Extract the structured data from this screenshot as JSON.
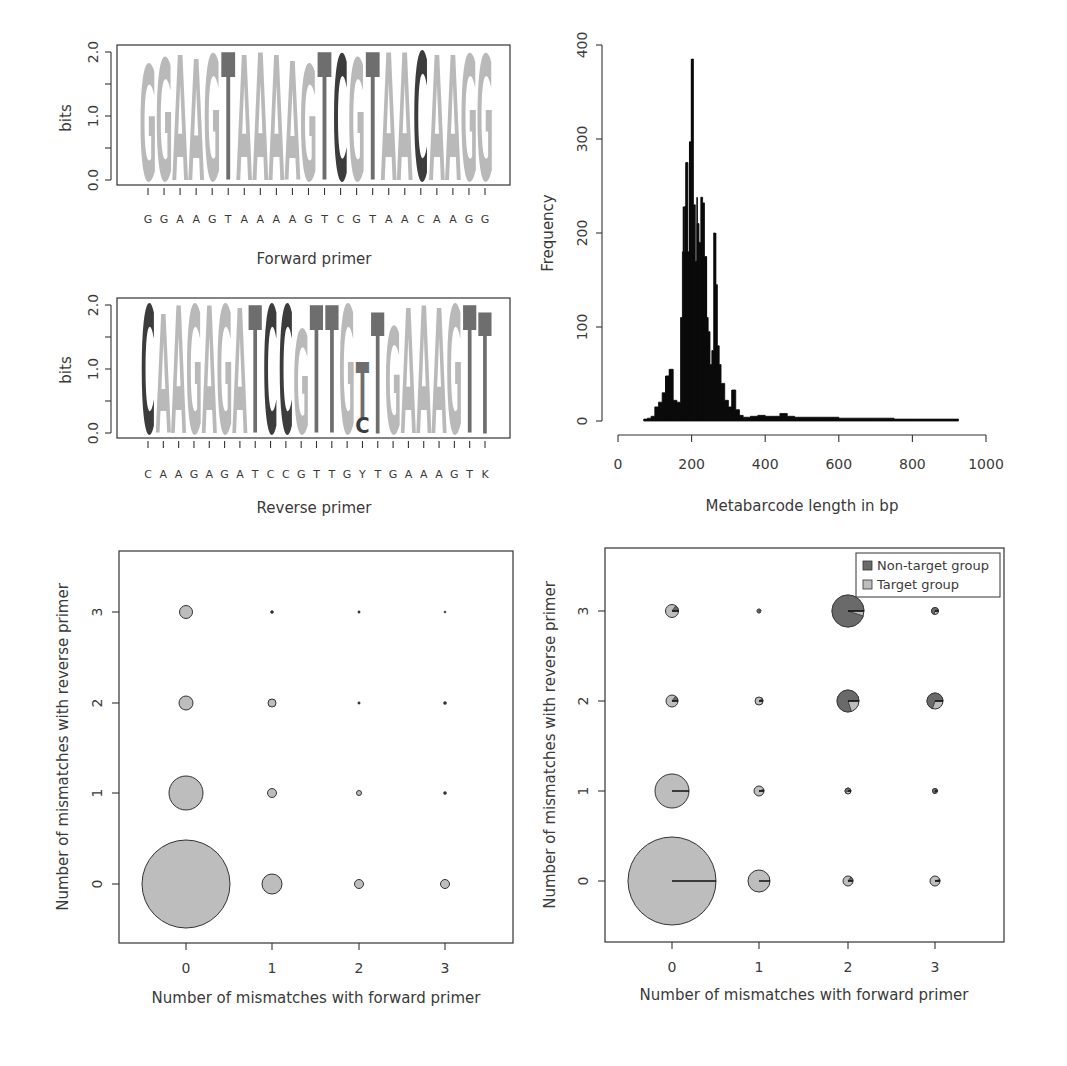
{
  "colors": {
    "A": "#b9b9b9",
    "G": "#b9b9b9",
    "C": "#3c3c3c",
    "T": "#6e6e6e",
    "target": "#bdbdbd",
    "non_target": "#6a6a6a",
    "histogram": "#0a0a0a",
    "axis": "#333333"
  },
  "chart_data": [
    {
      "id": "forward-logo",
      "type": "sequence-logo",
      "title": "",
      "xlabel": "Forward primer",
      "ylabel": "bits",
      "ylim": [
        0,
        2.0
      ],
      "yticks": [
        "0.0",
        "1.0",
        "2.0"
      ],
      "consensus": [
        "G",
        "G",
        "A",
        "A",
        "G",
        "T",
        "A",
        "A",
        "A",
        "A",
        "G",
        "T",
        "C",
        "G",
        "T",
        "A",
        "A",
        "C",
        "A",
        "A",
        "G",
        "G"
      ],
      "heights": [
        1.8,
        1.9,
        1.95,
        1.9,
        1.95,
        2.0,
        1.95,
        2.0,
        1.95,
        1.85,
        1.8,
        2.0,
        1.95,
        1.9,
        2.0,
        2.0,
        2.0,
        2.0,
        1.95,
        1.95,
        1.95,
        1.95
      ]
    },
    {
      "id": "reverse-logo",
      "type": "sequence-logo",
      "title": "",
      "xlabel": "Reverse primer",
      "ylabel": "bits",
      "ylim": [
        0,
        2.0
      ],
      "yticks": [
        "0.0",
        "1.0",
        "2.0"
      ],
      "consensus": [
        "C",
        "A",
        "A",
        "G",
        "A",
        "G",
        "A",
        "T",
        "C",
        "C",
        "G",
        "T",
        "T",
        "G",
        "Y",
        "T",
        "G",
        "A",
        "A",
        "A",
        "G",
        "T",
        "K"
      ],
      "heights": [
        2.0,
        1.85,
        2.0,
        2.0,
        2.0,
        2.0,
        1.95,
        2.0,
        2.0,
        2.0,
        1.6,
        2.0,
        2.0,
        2.0,
        1.2,
        1.9,
        1.65,
        1.95,
        2.0,
        1.95,
        2.0,
        2.0,
        1.9
      ],
      "stack_note": "Position Y: T (upper) over C (lower); position K: T dominant"
    },
    {
      "id": "length-histogram",
      "type": "bar",
      "title": "",
      "xlabel": "Metabarcode length in bp",
      "ylabel": "Frequency",
      "xlim": [
        0,
        1000
      ],
      "ylim": [
        0,
        400
      ],
      "xticks": [
        "0",
        "200",
        "400",
        "600",
        "800",
        "1000"
      ],
      "yticks": [
        "0",
        "100",
        "200",
        "300",
        "400"
      ],
      "x": [
        70,
        80,
        90,
        100,
        110,
        120,
        130,
        140,
        150,
        160,
        170,
        175,
        180,
        185,
        190,
        195,
        200,
        205,
        210,
        215,
        220,
        225,
        230,
        235,
        240,
        245,
        250,
        255,
        260,
        265,
        270,
        275,
        280,
        290,
        300,
        310,
        320,
        330,
        340,
        360,
        380,
        400,
        420,
        440,
        460,
        480,
        500,
        550,
        600,
        650,
        700,
        750,
        800,
        850,
        900,
        920
      ],
      "values": [
        2,
        3,
        5,
        15,
        20,
        30,
        48,
        55,
        22,
        20,
        110,
        180,
        228,
        275,
        180,
        297,
        385,
        230,
        170,
        210,
        190,
        238,
        232,
        175,
        110,
        95,
        60,
        75,
        200,
        145,
        80,
        60,
        40,
        22,
        15,
        33,
        12,
        6,
        4,
        5,
        6,
        5,
        5,
        8,
        5,
        4,
        4,
        4,
        3,
        3,
        3,
        2,
        2,
        2,
        2,
        2
      ]
    },
    {
      "id": "mismatch-bubble",
      "type": "scatter",
      "title": "",
      "xlabel": "Number of mismatches with forward primer",
      "ylabel": "Number of mismatches with reverse primer",
      "xticks": [
        "0",
        "1",
        "2",
        "3"
      ],
      "yticks": [
        "0",
        "1",
        "2",
        "3"
      ],
      "points": [
        {
          "x": 0,
          "y": 0,
          "r": 44
        },
        {
          "x": 1,
          "y": 0,
          "r": 10
        },
        {
          "x": 2,
          "y": 0,
          "r": 4.5
        },
        {
          "x": 3,
          "y": 0,
          "r": 4.5
        },
        {
          "x": 0,
          "y": 1,
          "r": 17
        },
        {
          "x": 1,
          "y": 1,
          "r": 4.5
        },
        {
          "x": 2,
          "y": 1,
          "r": 2.5
        },
        {
          "x": 3,
          "y": 1,
          "r": 1.5
        },
        {
          "x": 0,
          "y": 2,
          "r": 7
        },
        {
          "x": 1,
          "y": 2,
          "r": 4
        },
        {
          "x": 2,
          "y": 2,
          "r": 1.2
        },
        {
          "x": 3,
          "y": 2,
          "r": 1.5
        },
        {
          "x": 0,
          "y": 3,
          "r": 6.5
        },
        {
          "x": 1,
          "y": 3,
          "r": 1.5
        },
        {
          "x": 2,
          "y": 3,
          "r": 1.2
        },
        {
          "x": 3,
          "y": 3,
          "r": 1
        }
      ]
    },
    {
      "id": "mismatch-pie-bubble",
      "type": "scatter",
      "title": "",
      "xlabel": "Number of mismatches with forward primer",
      "ylabel": "Number of mismatches with reverse primer",
      "xticks": [
        "0",
        "1",
        "2",
        "3"
      ],
      "yticks": [
        "0",
        "1",
        "2",
        "3"
      ],
      "legend": [
        {
          "label": "Non-target group",
          "color": "#6a6a6a"
        },
        {
          "label": "Target group",
          "color": "#bdbdbd"
        }
      ],
      "legend_position": "top-right",
      "points": [
        {
          "x": 0,
          "y": 0,
          "r": 44,
          "non_target_frac": 0.0
        },
        {
          "x": 1,
          "y": 0,
          "r": 11,
          "non_target_frac": 0.0
        },
        {
          "x": 2,
          "y": 0,
          "r": 5,
          "non_target_frac": 0.15
        },
        {
          "x": 3,
          "y": 0,
          "r": 5,
          "non_target_frac": 0.05
        },
        {
          "x": 0,
          "y": 1,
          "r": 17,
          "non_target_frac": 0.0
        },
        {
          "x": 1,
          "y": 1,
          "r": 5,
          "non_target_frac": 0.05
        },
        {
          "x": 2,
          "y": 1,
          "r": 3,
          "non_target_frac": 0.6
        },
        {
          "x": 3,
          "y": 1,
          "r": 2.5,
          "non_target_frac": 0.8
        },
        {
          "x": 0,
          "y": 2,
          "r": 6,
          "non_target_frac": 0.15
        },
        {
          "x": 1,
          "y": 2,
          "r": 4,
          "non_target_frac": 0.1
        },
        {
          "x": 2,
          "y": 2,
          "r": 11,
          "non_target_frac": 0.8
        },
        {
          "x": 3,
          "y": 2,
          "r": 8,
          "non_target_frac": 0.7
        },
        {
          "x": 0,
          "y": 3,
          "r": 6.5,
          "non_target_frac": 0.15
        },
        {
          "x": 1,
          "y": 3,
          "r": 2,
          "non_target_frac": 0.9
        },
        {
          "x": 2,
          "y": 3,
          "r": 16,
          "non_target_frac": 0.95
        },
        {
          "x": 3,
          "y": 3,
          "r": 3.5,
          "non_target_frac": 0.7
        }
      ]
    }
  ],
  "labels": {
    "fwd_xlabel": "Forward primer",
    "rev_xlabel": "Reverse primer",
    "bits": "bits",
    "hist_xlabel": "Metabarcode length in bp",
    "hist_ylabel": "Frequency",
    "bubble_xlabel": "Number of mismatches with forward primer",
    "bubble_ylabel": "Number of mismatches with reverse primer",
    "legend_nontarget": "Non-target group",
    "legend_target": "Target group"
  }
}
